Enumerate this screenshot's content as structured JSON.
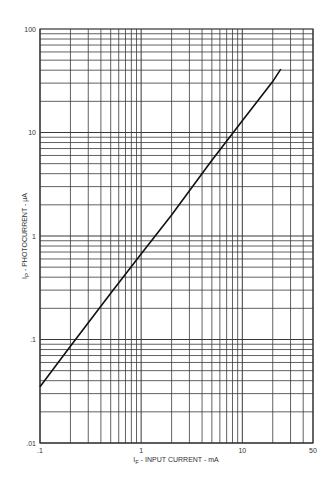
{
  "chart_data": {
    "type": "line",
    "title": "",
    "xlabel": "I_F - INPUT CURRENT - mA",
    "ylabel": "I_P - PHOTOCURRENT - µA",
    "xscale": "log",
    "yscale": "log",
    "xlim": [
      0.1,
      50
    ],
    "ylim": [
      0.01,
      100
    ],
    "x_tick_labels": [
      ".1",
      "1",
      "10",
      "50"
    ],
    "x_ticks": [
      0.1,
      1,
      10,
      50
    ],
    "y_tick_labels": [
      "100",
      "10",
      "1",
      ".1",
      ".01"
    ],
    "y_ticks": [
      100,
      10,
      1,
      0.1,
      0.01
    ],
    "grid": true,
    "legend": null,
    "series": [
      {
        "name": "Photocurrent vs Input Current",
        "x": [
          0.1,
          0.2,
          0.5,
          1,
          2,
          5,
          10,
          20,
          24
        ],
        "y": [
          0.035,
          0.086,
          0.28,
          0.67,
          1.6,
          5.4,
          13,
          31,
          41
        ]
      }
    ]
  },
  "labels": {
    "xlabel_main": "I",
    "xlabel_sub": "F",
    "xlabel_rest": " - INPUT CURRENT - mA",
    "ylabel_main": "I",
    "ylabel_sub": "P",
    "ylabel_rest": " - PHOTOCURRENT - µA"
  },
  "colors": {
    "grid": "#3a3a3a",
    "line": "#111111",
    "background": "#ffffff"
  }
}
